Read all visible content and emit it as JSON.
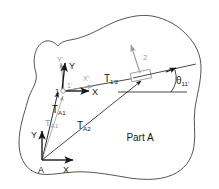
{
  "figure": {
    "part_label": "Part A",
    "background_color": "#ffffff",
    "ink_color": "#1a1a1a",
    "secondary_color": "#9a9a9a",
    "outline_color": "#555555"
  },
  "frames": [
    {
      "id": "frame-1",
      "origin_label": "1",
      "origin_label_prime": "1'",
      "axes": [
        {
          "name": "x-axis",
          "label": "X",
          "color": "#1a1a1a"
        },
        {
          "name": "y-axis",
          "label": "Y",
          "color": "#1a1a1a"
        },
        {
          "name": "x-prime-axis",
          "label": "X'",
          "color": "#9a9a9a"
        },
        {
          "name": "y-prime-axis",
          "label": "Y'",
          "color": "#9a9a9a"
        }
      ]
    },
    {
      "id": "frame-a",
      "origin_label": "A",
      "axes": [
        {
          "name": "x-axis",
          "label": "X",
          "color": "#1a1a1a"
        },
        {
          "name": "y-axis",
          "label": "Y",
          "color": "#1a1a1a"
        }
      ]
    }
  ],
  "features": [
    {
      "id": "feature-2",
      "label": "2",
      "color": "#9a9a9a"
    }
  ],
  "vectors": [
    {
      "id": "T_A1",
      "base": "T",
      "sub": "A1",
      "color": "#1a1a1a"
    },
    {
      "id": "T_A1p",
      "base": "T",
      "sub": "A1'",
      "color": "#9a9a9a"
    },
    {
      "id": "T_A2",
      "base": "T",
      "sub": "A2",
      "color": "#1a1a1a"
    },
    {
      "id": "T_1p2",
      "base": "T",
      "sub": "1'2",
      "color": "#1a1a1a"
    }
  ],
  "angles": [
    {
      "id": "theta_11p",
      "base": "θ",
      "sub": "11'",
      "color": "#1a1a1a"
    }
  ],
  "labels": {
    "T": "T",
    "sub_A1": "A1",
    "sub_A1p": "A1'",
    "sub_A2": "A2",
    "sub_1p2": "1'2",
    "theta": "θ",
    "sub_11p": "11'",
    "axis_X": "X",
    "axis_Y": "Y",
    "axis_Xp": "X'",
    "axis_Yp": "Y'",
    "point_1": "1",
    "point_1p": "1'",
    "point_2": "2",
    "point_A": "A",
    "part_a": "Part A"
  }
}
